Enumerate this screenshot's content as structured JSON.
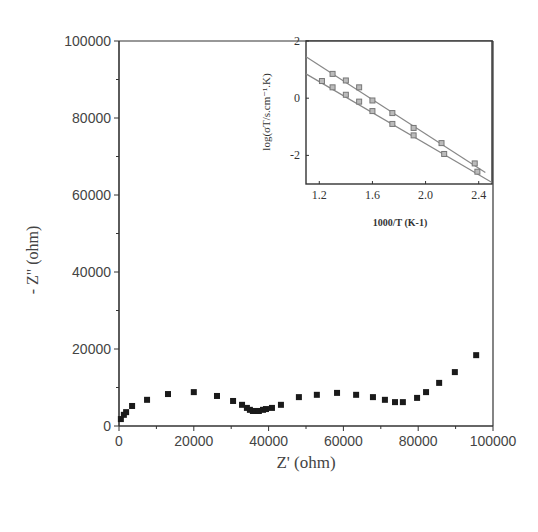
{
  "chart_data": [
    {
      "id": "main",
      "type": "scatter",
      "title": "",
      "xlabel": "Z' (ohm)",
      "ylabel": "- Z\" (ohm)",
      "xlim": [
        0,
        100000
      ],
      "ylim": [
        0,
        100000
      ],
      "xticks": [
        "0",
        "20000",
        "40000",
        "60000",
        "80000",
        "100000"
      ],
      "yticks": [
        "0",
        "20000",
        "40000",
        "60000",
        "80000",
        "100000"
      ],
      "grid": false,
      "legend": null,
      "series": [
        {
          "name": "impedance",
          "marker": "square",
          "color": "#1a1a1a",
          "x": [
            500,
            1300,
            1900,
            3500,
            7500,
            13100,
            20000,
            26200,
            30500,
            32900,
            34200,
            35000,
            35800,
            36600,
            37400,
            38500,
            39300,
            40900,
            43300,
            48100,
            52900,
            58300,
            63400,
            67900,
            71100,
            73800,
            75900,
            79700,
            82100,
            85600,
            89800,
            95500
          ],
          "y": [
            1800,
            2900,
            3600,
            5200,
            6800,
            8300,
            8800,
            7800,
            6500,
            5500,
            4700,
            4200,
            3900,
            3900,
            3900,
            4200,
            4400,
            4700,
            5500,
            7500,
            8100,
            8600,
            8100,
            7500,
            6800,
            6200,
            6200,
            7300,
            8800,
            11200,
            14000,
            18400
          ]
        }
      ]
    },
    {
      "id": "inset",
      "type": "scatter",
      "title": "",
      "xlabel": "1000/T (K-1)",
      "ylabel": "log(σT/s.cm⁻¹.K)",
      "xlim": [
        1.1,
        2.5
      ],
      "ylim": [
        -3,
        2
      ],
      "xticks": [
        "1.2",
        "1.6",
        "2.0",
        "2.4"
      ],
      "yticks": [
        "-2",
        "0",
        "2"
      ],
      "grid": false,
      "legend": null,
      "series": [
        {
          "name": "upper",
          "marker": "square",
          "color": "#777777",
          "x": [
            1.3,
            1.4,
            1.5,
            1.6,
            1.75,
            1.91,
            2.12,
            2.37
          ],
          "y": [
            0.85,
            0.62,
            0.38,
            -0.08,
            -0.52,
            -1.04,
            -1.57,
            -2.28
          ],
          "fit": {
            "x": [
              1.1,
              2.45
            ],
            "y": [
              1.45,
              -2.6
            ]
          }
        },
        {
          "name": "lower",
          "marker": "square",
          "color": "#777777",
          "x": [
            1.22,
            1.3,
            1.4,
            1.5,
            1.6,
            1.75,
            1.91,
            2.14,
            2.39
          ],
          "y": [
            0.6,
            0.38,
            0.12,
            -0.12,
            -0.45,
            -0.9,
            -1.3,
            -1.95,
            -2.57
          ],
          "fit": {
            "x": [
              1.1,
              2.5
            ],
            "y": [
              0.85,
              -2.95
            ]
          }
        }
      ]
    }
  ],
  "labels": {
    "main_xlabel": "Z' (ohm)",
    "main_ylabel": "- Z\" (ohm)",
    "inset_xlabel": "1000/T (K-1)",
    "inset_ylabel": "log(σT/s.cm⁻¹.K)"
  }
}
